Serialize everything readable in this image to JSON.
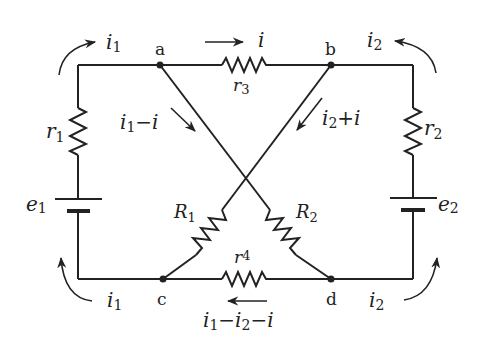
{
  "diagram": {
    "colors": {
      "ink": "#222222",
      "background": "#ffffff"
    },
    "nodes": [
      {
        "id": "a",
        "label": "a"
      },
      {
        "id": "b",
        "label": "b"
      },
      {
        "id": "c",
        "label": "c"
      },
      {
        "id": "d",
        "label": "d"
      }
    ],
    "components": {
      "r1": {
        "sym": "r",
        "sub": "1",
        "type": "resistor"
      },
      "r2": {
        "sym": "r",
        "sub": "2",
        "type": "resistor"
      },
      "r3": {
        "sym": "r",
        "sub": "3",
        "type": "resistor"
      },
      "r4": {
        "sym": "r",
        "sub": "4",
        "type": "resistor"
      },
      "R1": {
        "sym": "R",
        "sub": "1",
        "type": "resistor"
      },
      "R2": {
        "sym": "R",
        "sub": "2",
        "type": "resistor"
      },
      "e1": {
        "sym": "e",
        "sub": "1",
        "type": "battery"
      },
      "e2": {
        "sym": "e",
        "sub": "2",
        "type": "battery"
      }
    },
    "currents": {
      "top_left": {
        "sym": "i",
        "sub": "1"
      },
      "top_right": {
        "sym": "i",
        "sub": "2"
      },
      "bottom_left": {
        "sym": "i",
        "sub": "1"
      },
      "bottom_right": {
        "sym": "i",
        "sub": "2"
      },
      "r3_branch": {
        "sym": "i"
      },
      "a_to_d": {
        "p1": "i",
        "s1": "1",
        "op": "−",
        "p2": "i"
      },
      "b_to_c": {
        "p1": "i",
        "s1": "2",
        "op": "+",
        "p2": "i"
      },
      "r4_branch": {
        "p1": "i",
        "s1": "1",
        "op1": "−",
        "p2": "i",
        "s2": "2",
        "op2": "−",
        "p3": "i"
      }
    }
  }
}
